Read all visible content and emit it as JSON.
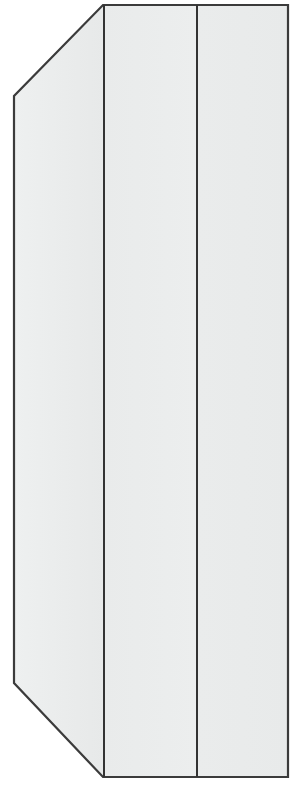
{
  "figure": {
    "background_color": "#ffffff",
    "canvas_width": 300,
    "canvas_height": 789,
    "stroke_color": "#3b3b3b",
    "stroke_width": 2.2,
    "fill_side_panel": "#ebeded",
    "fill_door_left": "#e9ebeb",
    "fill_door_right": "#eaecec",
    "divider_color": "#333333",
    "divider_width": 2.0
  },
  "geometry": {
    "side_panel": {
      "name": "left-side-panel",
      "points": "103,5 103,777 14,683 14,96",
      "description": "Chamfered left side face shown in perspective"
    },
    "door_left": {
      "name": "front-door-left",
      "points": "104,5 197,5 197,777 104,777",
      "description": "Left front door panel"
    },
    "door_right": {
      "name": "front-door-right",
      "points": "197,5 288,5 288,777 197,777",
      "description": "Right front door panel"
    },
    "outline": {
      "name": "body-outline",
      "points": "103,5 288,5 288,777 103,777 14,683 14,96"
    },
    "divider_1": {
      "name": "door-divider-left",
      "x": 104,
      "y1": 5,
      "y2": 777
    },
    "divider_2": {
      "name": "door-divider-center",
      "x": 197,
      "y1": 5,
      "y2": 777
    }
  },
  "vertices": {
    "top_front_left": [
      103,
      5
    ],
    "top_front_right": [
      288,
      5
    ],
    "bottom_front_right": [
      288,
      777
    ],
    "bottom_front_left": [
      103,
      777
    ],
    "bottom_back_left": [
      14,
      683
    ],
    "top_back_left": [
      14,
      96
    ]
  },
  "labels": {
    "figure_caption": "",
    "dimension_text": ""
  }
}
